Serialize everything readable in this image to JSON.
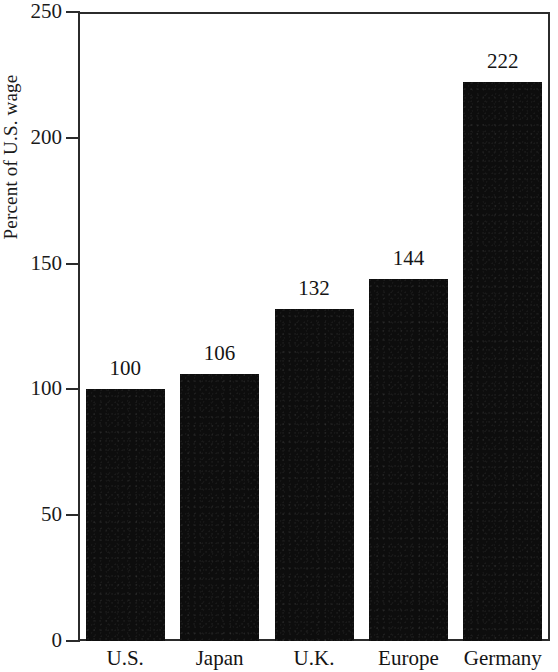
{
  "chart_data": {
    "type": "bar",
    "title": "",
    "xlabel": "",
    "ylabel": "Percent of U.S. wage",
    "categories": [
      "U.S.",
      "Japan",
      "U.K.",
      "Europe",
      "Germany"
    ],
    "values": [
      100,
      106,
      132,
      144,
      222
    ],
    "value_labels": [
      "100",
      "106",
      "132",
      "144",
      "222"
    ],
    "ylim": [
      0,
      250
    ],
    "yticks": [
      0,
      50,
      100,
      150,
      200,
      250
    ],
    "ytick_labels": [
      "0",
      "50",
      "100",
      "150",
      "200",
      "250"
    ],
    "grid": false,
    "legend": false,
    "bar_color": "#0d0d0d",
    "axis_color": "#2b2b2b",
    "background": "#ffffff"
  },
  "axis": {
    "y_title": "Percent of U.S. wage",
    "ticks": [
      {
        "label": "250",
        "value": 250
      },
      {
        "label": "200",
        "value": 200
      },
      {
        "label": "150",
        "value": 150
      },
      {
        "label": "100",
        "value": 100
      },
      {
        "label": "50",
        "value": 50
      },
      {
        "label": "0",
        "value": 0
      }
    ]
  },
  "bars": [
    {
      "category": "U.S.",
      "value": 100,
      "label": "100"
    },
    {
      "category": "Japan",
      "value": 106,
      "label": "106"
    },
    {
      "category": "U.K.",
      "value": 132,
      "label": "132"
    },
    {
      "category": "Europe",
      "value": 144,
      "label": "144"
    },
    {
      "category": "Germany",
      "value": 222,
      "label": "222"
    }
  ]
}
